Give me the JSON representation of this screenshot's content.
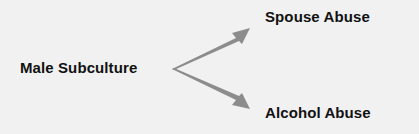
{
  "diagram": {
    "source": {
      "label": "Male Subculture"
    },
    "targets": [
      {
        "label": "Spouse Abuse"
      },
      {
        "label": "Alcohol Abuse"
      }
    ],
    "colors": {
      "background": "#f1f1f1",
      "arrow": "#8c8c8c",
      "text": "#111111"
    }
  }
}
